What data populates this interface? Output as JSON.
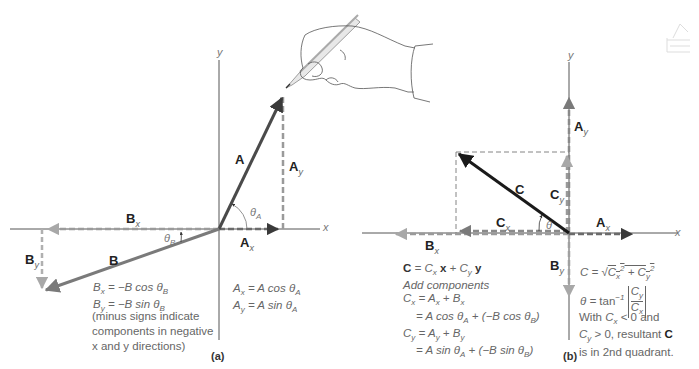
{
  "panel_a": {
    "label": "(a)",
    "axes": {
      "x": "x",
      "y": "y"
    },
    "vectors": {
      "A": {
        "label": "A",
        "x_comp": "A",
        "x_sub": "x",
        "y_comp": "A",
        "y_sub": "y"
      },
      "B": {
        "label": "B",
        "x_comp": "B",
        "x_sub": "x",
        "y_comp": "B",
        "y_sub": "y"
      }
    },
    "angles": {
      "theta_a": "θ",
      "theta_a_sub": "A",
      "theta_b": "θ",
      "theta_b_sub": "B"
    },
    "equations_b": [
      {
        "lhs": "B",
        "sub": "x",
        "rhs": "= −B cos θ",
        "rsub": "B"
      },
      {
        "lhs": "B",
        "sub": "y",
        "rhs": "= −B sin  θ",
        "rsub": "B"
      }
    ],
    "note_lines": [
      "(minus signs indicate",
      "components in negative",
      "x and y directions)"
    ],
    "equations_a": [
      {
        "lhs": "A",
        "sub": "x",
        "rhs": "= A cos θ",
        "rsub": "A"
      },
      {
        "lhs": "A",
        "sub": "y",
        "rhs": "= A sin θ",
        "rsub": "A"
      }
    ]
  },
  "panel_b": {
    "label": "(b)",
    "axes": {
      "x": "x",
      "y": "y"
    },
    "vectors": {
      "C": "C",
      "Cx": "C",
      "Cx_sub": "x",
      "Cy": "C",
      "Cy_sub": "y",
      "Ax": "A",
      "Ax_sub": "x",
      "Ay": "A",
      "Ay_sub": "y",
      "Bx": "B",
      "Bx_sub": "x",
      "By": "B",
      "By_sub": "y"
    },
    "angle": "θ",
    "sum": {
      "line1": "C = Cx x + Cy y",
      "line2": "Add components",
      "line3": "Cx = Ax + Bx",
      "line4": "= A cos θA + (−B cos θB)",
      "line5": "Cy = Ay + By",
      "line6": "= A sin  θA + (−B sin θB)"
    },
    "magnitude": "C = √(Cx² + Cy²)",
    "direction": "θ = tan⁻¹ |Cy / Cx|",
    "conclusion_lines": [
      "With Cx < 0 and",
      "Cy > 0, resultant C",
      "is in 2nd quadrant."
    ]
  },
  "colors": {
    "axis": "#666666",
    "vector_a": "#4a4a4a",
    "vector_b": "#7a7a7a",
    "vector_c": "#1a1a1a",
    "component": "#9a9a9a"
  }
}
